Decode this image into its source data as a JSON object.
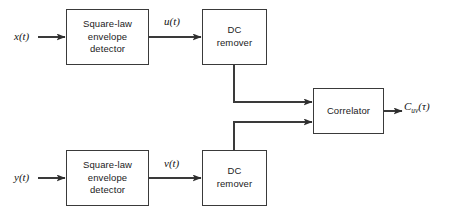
{
  "diagram": {
    "background_color": "#ffffff",
    "line_color": "#3a3a3a",
    "blocks": [
      {
        "id": "sq_top",
        "label": "Square-law\nenvelope\ndetector"
      },
      {
        "id": "dc_top",
        "label": "DC\nremover"
      },
      {
        "id": "correlator",
        "label": "Correlator"
      },
      {
        "id": "sq_bot",
        "label": "Square-law\nenvelope\ndetector"
      },
      {
        "id": "dc_bot",
        "label": "DC\nremover"
      }
    ],
    "signals": {
      "input_top": "x(t)",
      "mid_top": "u(t)",
      "input_bottom": "y(t)",
      "mid_bottom": "v(t)",
      "output_base": "C",
      "output_subscript": "uv",
      "output_argument": "(τ)"
    },
    "caption": ""
  }
}
